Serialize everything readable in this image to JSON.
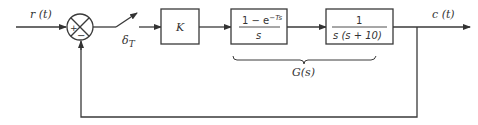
{
  "diagram": {
    "type": "sampled-data feedback control block diagram",
    "input": {
      "label": "r (t)"
    },
    "output": {
      "label": "c (t)"
    },
    "summing_junction": {
      "plus_sign": "+",
      "minus_sign": "−"
    },
    "sampler": {
      "label_main": "δ",
      "label_sub": "T"
    },
    "blocks": [
      {
        "id": "gain",
        "label": "K"
      },
      {
        "id": "zoh",
        "numerator": "1 − e",
        "numerator_exp": "−Ts",
        "denominator": "s"
      },
      {
        "id": "plant",
        "numerator": "1",
        "denominator": "s (s + 10)"
      }
    ],
    "brace": {
      "label": "G(s)"
    },
    "feedback": {
      "type": "unity negative feedback"
    }
  }
}
